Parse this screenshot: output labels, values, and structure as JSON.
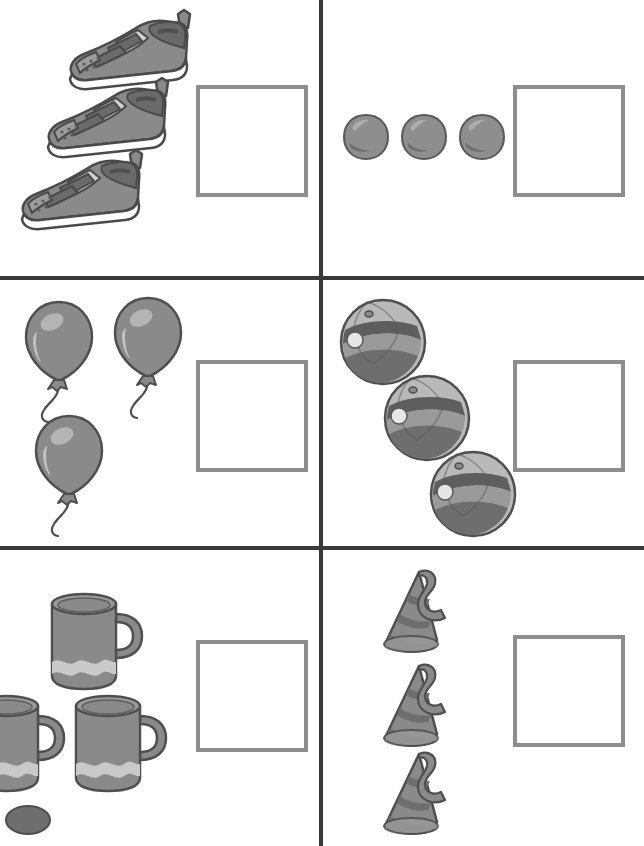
{
  "worksheet": {
    "type": "counting-worksheet",
    "title": "Count the objects and write the number",
    "grid": {
      "rows": 3,
      "columns": 2,
      "cells": 6
    },
    "palette": {
      "divider": "#3a3a3a",
      "answer_box_border": "#8d8d8d",
      "background": "#ffffff",
      "object_mid": "#8a8a8a",
      "object_dark": "#6a6a6a",
      "object_light": "#b8b8b8",
      "object_highlight": "#d8d8d8",
      "outline": "#4a4a4a"
    },
    "cells": [
      {
        "index": 0,
        "position": "top-left",
        "object_name": "sneaker",
        "object_label": "Sneakers",
        "count": 3,
        "arrangement": "diagonal-descending",
        "answer": "",
        "answer_placeholder": ""
      },
      {
        "index": 1,
        "position": "top-right",
        "object_name": "ball",
        "object_label": "Balls",
        "count": 3,
        "arrangement": "horizontal-row",
        "answer": "",
        "answer_placeholder": ""
      },
      {
        "index": 2,
        "position": "middle-left",
        "object_name": "balloon",
        "object_label": "Balloons",
        "count": 3,
        "arrangement": "two-top-one-below",
        "answer": "",
        "answer_placeholder": ""
      },
      {
        "index": 3,
        "position": "middle-right",
        "object_name": "beach-ball",
        "object_label": "Beach balls",
        "count": 3,
        "arrangement": "diagonal-descending",
        "answer": "",
        "answer_placeholder": ""
      },
      {
        "index": 4,
        "position": "bottom-left",
        "object_name": "mug",
        "object_label": "Mugs",
        "count": 3,
        "arrangement": "one-top-two-below",
        "answer": "",
        "answer_placeholder": ""
      },
      {
        "index": 5,
        "position": "bottom-right",
        "object_name": "party-hat",
        "object_label": "Party hats",
        "count": 3,
        "arrangement": "vertical-column",
        "answer": "",
        "answer_placeholder": ""
      }
    ]
  }
}
